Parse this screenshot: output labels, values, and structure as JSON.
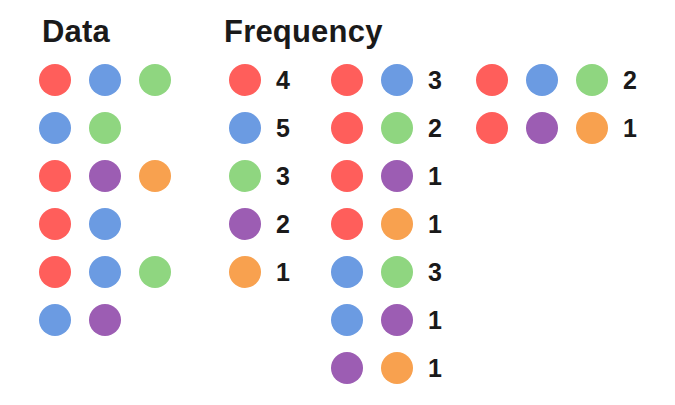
{
  "colors": {
    "red": "#FF5E5B",
    "blue": "#6B9BE2",
    "green": "#8FD680",
    "purple": "#9C5DB3",
    "orange": "#F8A14F"
  },
  "data_section": {
    "title": "Data",
    "rows": [
      [
        "red",
        "blue",
        "green"
      ],
      [
        "blue",
        "green"
      ],
      [
        "red",
        "purple",
        "orange"
      ],
      [
        "red",
        "blue"
      ],
      [
        "red",
        "blue",
        "green"
      ],
      [
        "blue",
        "purple"
      ]
    ]
  },
  "frequency_section": {
    "title": "Frequency",
    "singles": [
      {
        "items": [
          "red"
        ],
        "count": "4"
      },
      {
        "items": [
          "blue"
        ],
        "count": "5"
      },
      {
        "items": [
          "green"
        ],
        "count": "3"
      },
      {
        "items": [
          "purple"
        ],
        "count": "2"
      },
      {
        "items": [
          "orange"
        ],
        "count": "1"
      }
    ],
    "pairs": [
      {
        "items": [
          "red",
          "blue"
        ],
        "count": "3"
      },
      {
        "items": [
          "red",
          "green"
        ],
        "count": "2"
      },
      {
        "items": [
          "red",
          "purple"
        ],
        "count": "1"
      },
      {
        "items": [
          "red",
          "orange"
        ],
        "count": "1"
      },
      {
        "items": [
          "blue",
          "green"
        ],
        "count": "3"
      },
      {
        "items": [
          "blue",
          "purple"
        ],
        "count": "1"
      },
      {
        "items": [
          "purple",
          "orange"
        ],
        "count": "1"
      }
    ],
    "triples": [
      {
        "items": [
          "red",
          "blue",
          "green"
        ],
        "count": "2"
      },
      {
        "items": [
          "red",
          "purple",
          "orange"
        ],
        "count": "1"
      }
    ]
  }
}
